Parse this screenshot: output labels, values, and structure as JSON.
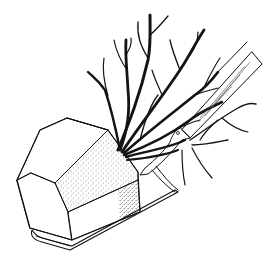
{
  "illustration": {
    "subject": "balled-and-burlapped shrub on a spade",
    "style": "black ink line drawing with stippling",
    "parts": [
      "root-ball",
      "spade-blade",
      "spade-handle",
      "branches"
    ]
  },
  "colors": {
    "background": "#ffffff",
    "ink": "#111111"
  }
}
